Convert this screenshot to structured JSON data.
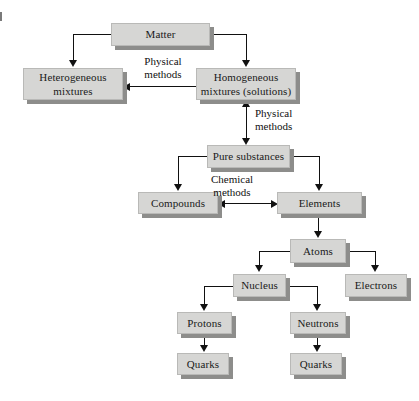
{
  "diagram": {
    "colors": {
      "box_fill": "#d6d6d4",
      "box_border": "#b9b9b7",
      "box_shadow": "#8d8d8b",
      "line": "#111111",
      "background": "#ffffff"
    },
    "nodes": [
      {
        "id": "matter",
        "label": "Matter"
      },
      {
        "id": "heterogeneous",
        "label": "Heterogeneous\nmixtures"
      },
      {
        "id": "homogeneous",
        "label": "Homogeneous\nmixtures (solutions)"
      },
      {
        "id": "pure",
        "label": "Pure substances"
      },
      {
        "id": "compounds",
        "label": "Compounds"
      },
      {
        "id": "elements",
        "label": "Elements"
      },
      {
        "id": "atoms",
        "label": "Atoms"
      },
      {
        "id": "nucleus",
        "label": "Nucleus"
      },
      {
        "id": "electrons",
        "label": "Electrons"
      },
      {
        "id": "protons",
        "label": "Protons"
      },
      {
        "id": "neutrons",
        "label": "Neutrons"
      },
      {
        "id": "quarks_left",
        "label": "Quarks"
      },
      {
        "id": "quarks_right",
        "label": "Quarks"
      }
    ],
    "edge_labels": [
      {
        "id": "physical_1",
        "label": "Physical\nmethods"
      },
      {
        "id": "physical_2",
        "label": "Physical\nmethods"
      },
      {
        "id": "chemical_1",
        "label": "Chemical\nmethods"
      }
    ]
  }
}
